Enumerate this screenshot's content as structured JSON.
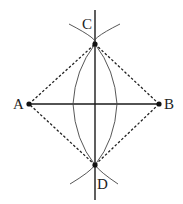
{
  "diagram": {
    "points": {
      "A": {
        "label": "A",
        "x": 29,
        "y": 104
      },
      "B": {
        "label": "B",
        "x": 159,
        "y": 104
      },
      "C": {
        "label": "C",
        "x": 95,
        "y": 44
      },
      "D": {
        "label": "D",
        "x": 95,
        "y": 165
      }
    },
    "colors": {
      "line": "#1a1a1a",
      "arc": "#444444",
      "point": "#111111"
    }
  }
}
